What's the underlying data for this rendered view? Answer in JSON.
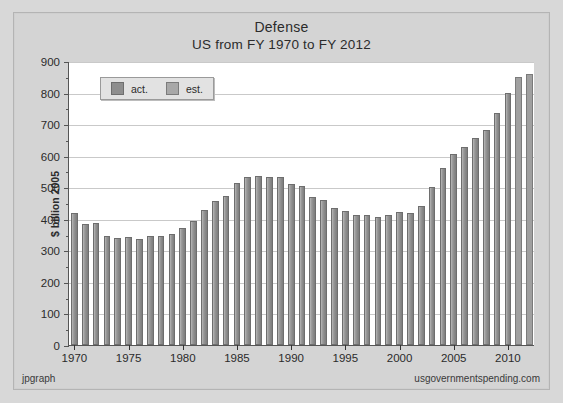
{
  "chart_data": {
    "type": "bar",
    "title": "Defense",
    "subtitle": "US from FY 1970 to FY 2012",
    "xlabel": "",
    "ylabel": "$ billion 2005",
    "ylim": [
      0,
      900
    ],
    "ytick_values": [
      0,
      100,
      200,
      300,
      400,
      500,
      600,
      700,
      800,
      900
    ],
    "ytick_labels": [
      "0",
      "100",
      "200",
      "300",
      "400",
      "500",
      "600",
      "700",
      "800",
      "900"
    ],
    "xtick_labels": [
      "1970",
      "1975",
      "1980",
      "1985",
      "1990",
      "1995",
      "2000",
      "2005",
      "2010"
    ],
    "grid": true,
    "legend_position": "top-left",
    "legend": [
      {
        "label": "act.",
        "color": "#8e8e8e"
      },
      {
        "label": "est.",
        "color": "#a8a8a8"
      }
    ],
    "categories": [
      "1970",
      "1971",
      "1972",
      "1973",
      "1974",
      "1975",
      "1976",
      "1977",
      "1978",
      "1979",
      "1980",
      "1981",
      "1982",
      "1983",
      "1984",
      "1985",
      "1986",
      "1987",
      "1988",
      "1989",
      "1990",
      "1991",
      "1992",
      "1993",
      "1994",
      "1995",
      "1996",
      "1997",
      "1998",
      "1999",
      "2000",
      "2001",
      "2002",
      "2003",
      "2004",
      "2005",
      "2006",
      "2007",
      "2008",
      "2009",
      "2010",
      "2011",
      "2012"
    ],
    "values": [
      418,
      385,
      386,
      345,
      340,
      341,
      337,
      344,
      346,
      352,
      370,
      394,
      429,
      455,
      473,
      515,
      534,
      537,
      531,
      532,
      511,
      503,
      470,
      460,
      435,
      426,
      411,
      411,
      407,
      412,
      420,
      418,
      440,
      501,
      561,
      605,
      627,
      655,
      682,
      736,
      800,
      849,
      860
    ],
    "series_kind": [
      "act.",
      "act.",
      "act.",
      "act.",
      "act.",
      "act.",
      "act.",
      "act.",
      "act.",
      "act.",
      "act.",
      "act.",
      "act.",
      "act.",
      "act.",
      "act.",
      "act.",
      "act.",
      "act.",
      "act.",
      "act.",
      "act.",
      "act.",
      "act.",
      "act.",
      "act.",
      "act.",
      "act.",
      "act.",
      "act.",
      "act.",
      "act.",
      "act.",
      "act.",
      "act.",
      "act.",
      "act.",
      "act.",
      "act.",
      "act.",
      "act.",
      "est.",
      "est."
    ]
  },
  "footer": {
    "left": "jpgraph",
    "right": "usgovernmentspending.com"
  }
}
